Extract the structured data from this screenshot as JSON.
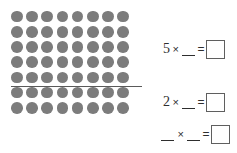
{
  "worksheet": {
    "array": {
      "name": "dot-array",
      "rows": 7,
      "columns": 8,
      "total_dots": 56,
      "dot_color": "#7c7c7c",
      "partition": {
        "after_row": 5,
        "rows_above": 5,
        "rows_below": 2,
        "line_color": "#5a5a5a"
      }
    },
    "equations": [
      {
        "id": "equation-1",
        "factor1": "5",
        "operator": "×",
        "factor2": "__",
        "equals": "=",
        "answer": ""
      },
      {
        "id": "equation-2",
        "factor1": "2",
        "operator": "×",
        "factor2": "__",
        "equals": "=",
        "answer": ""
      },
      {
        "id": "equation-3",
        "factor1": "__",
        "operator": "×",
        "factor2": "__",
        "equals": "=",
        "answer": ""
      }
    ]
  }
}
